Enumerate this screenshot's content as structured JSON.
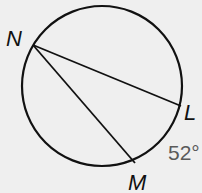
{
  "diagram": {
    "type": "circle-inscribed-angle",
    "background": "#efefef",
    "stroke_color": "#111111",
    "circle": {
      "cx": 102,
      "cy": 86,
      "r": 80
    },
    "points": [
      {
        "id": "N",
        "label": "N",
        "x": 33,
        "y": 45,
        "label_x": 6,
        "label_y": 46
      },
      {
        "id": "L",
        "label": "L",
        "x": 181,
        "y": 106,
        "label_x": 184,
        "label_y": 120
      },
      {
        "id": "M",
        "label": "M",
        "x": 135,
        "y": 163,
        "label_x": 128,
        "label_y": 190
      }
    ],
    "chords": [
      {
        "from": "N",
        "to": "L"
      },
      {
        "from": "N",
        "to": "M"
      }
    ],
    "arc_measure": {
      "arc": "LM",
      "text": "52°",
      "color": "#5a5a5a",
      "x": 168,
      "y": 160
    }
  }
}
